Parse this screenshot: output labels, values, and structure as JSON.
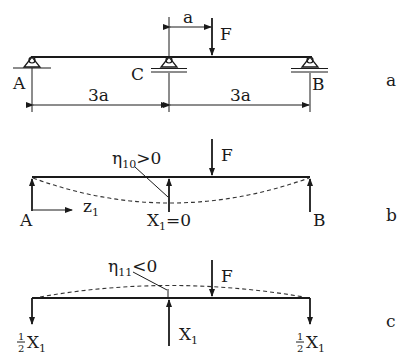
{
  "figure": {
    "parts": [
      {
        "id": "a",
        "panel_label": "a",
        "supports": [
          {
            "name": "A",
            "label": "A"
          },
          {
            "name": "C",
            "label": "C"
          },
          {
            "name": "B",
            "label": "B"
          }
        ],
        "force_label": "F",
        "force_offset_label": "a",
        "span_left_label": "3a",
        "span_right_label": "3a"
      },
      {
        "id": "b",
        "panel_label": "b",
        "force_label": "F",
        "left_reaction_label": "A",
        "right_reaction_label": "B",
        "coordinate_label": "z",
        "coordinate_sub": "1",
        "deflection_label": "η",
        "deflection_sub": "10",
        "deflection_cond": ">0",
        "redundant_label": "X",
        "redundant_sub": "1",
        "redundant_value": "=0"
      },
      {
        "id": "c",
        "panel_label": "c",
        "force_label": "F",
        "deflection_label": "η",
        "deflection_sub": "11",
        "deflection_cond": "<0",
        "center_label": "X",
        "center_sub": "1",
        "end_frac_num": "1",
        "end_frac_den": "2",
        "end_label": "X",
        "end_sub": "1"
      }
    ]
  }
}
